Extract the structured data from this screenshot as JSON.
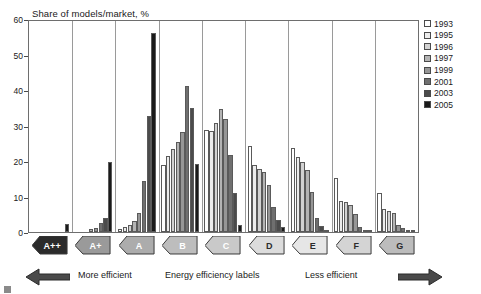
{
  "chart": {
    "title": "Share of models/market, %",
    "yaxis": {
      "label": "Share of models/market, %",
      "ticks": [
        "0",
        "10",
        "20",
        "30",
        "40",
        "50",
        "60"
      ]
    },
    "footer": {
      "more_efficient": "More efficient",
      "center": "Energy efficiency labels",
      "less_efficient": "Less efficient",
      "left_arrow_icon": "arrow-left-icon",
      "right_arrow_icon": "arrow-right-icon"
    },
    "legend": {
      "position": "right",
      "entries": [
        {
          "label": "1993",
          "color": "#ffffff"
        },
        {
          "label": "1995",
          "color": "#ececec"
        },
        {
          "label": "1996",
          "color": "#d2d2d2"
        },
        {
          "label": "1997",
          "color": "#b4b4b4"
        },
        {
          "label": "1999",
          "color": "#969696"
        },
        {
          "label": "2001",
          "color": "#6f6f6f"
        },
        {
          "label": "2003",
          "color": "#4b4b4b"
        },
        {
          "label": "2005",
          "color": "#1a1a1a"
        }
      ]
    },
    "labels": [
      {
        "text": "A++",
        "fill": "#2b2b2b",
        "textColor": "#ffffff"
      },
      {
        "text": "A+",
        "fill": "#9a9a9a",
        "textColor": "#ffffff"
      },
      {
        "text": "A",
        "fill": "#acacac",
        "textColor": "#ffffff"
      },
      {
        "text": "B",
        "fill": "#bdbdbd",
        "textColor": "#ffffff"
      },
      {
        "text": "C",
        "fill": "#c9c9c9",
        "textColor": "#ffffff"
      },
      {
        "text": "D",
        "fill": "#dcdcdc",
        "textColor": "#2b2b2b"
      },
      {
        "text": "E",
        "fill": "#e6e6e6",
        "textColor": "#2b2b2b"
      },
      {
        "text": "F",
        "fill": "#d4d4d4",
        "textColor": "#2b2b2b"
      },
      {
        "text": "G",
        "fill": "#bcbcbc",
        "textColor": "#2b2b2b"
      }
    ]
  },
  "chart_data": {
    "type": "bar",
    "title": "Share of models/market, %",
    "xlabel": "Energy efficiency labels",
    "ylabel": "Share of models/market, %",
    "ylim": [
      0,
      60
    ],
    "yticks": [
      0,
      10,
      20,
      30,
      40,
      50,
      60
    ],
    "grid": false,
    "legend_position": "right",
    "categories": [
      "A++",
      "A+",
      "A",
      "B",
      "C",
      "D",
      "E",
      "F",
      "G"
    ],
    "series": [
      {
        "name": "1993",
        "color": "#ffffff",
        "values": [
          0,
          0,
          0.8,
          19.0,
          29.0,
          24.5,
          23.8,
          15.3,
          11.0
        ]
      },
      {
        "name": "1995",
        "color": "#ececec",
        "values": [
          0,
          0,
          1.5,
          21.5,
          28.8,
          19.0,
          21.3,
          8.8,
          6.5
        ]
      },
      {
        "name": "1996",
        "color": "#d2d2d2",
        "values": [
          0,
          0,
          2.0,
          23.5,
          31.0,
          18.0,
          19.8,
          8.5,
          6.0
        ]
      },
      {
        "name": "1997",
        "color": "#b4b4b4",
        "values": [
          0,
          0.8,
          3.0,
          25.5,
          35.0,
          17.0,
          17.5,
          7.8,
          5.5
        ]
      },
      {
        "name": "1999",
        "color": "#969696",
        "values": [
          0,
          1.2,
          5.5,
          28.5,
          32.0,
          13.5,
          11.5,
          5.0,
          2.0
        ]
      },
      {
        "name": "2001",
        "color": "#6f6f6f",
        "values": [
          0,
          2.5,
          14.5,
          41.5,
          22.0,
          7.0,
          4.0,
          1.5,
          1.0
        ]
      },
      {
        "name": "2003",
        "color": "#4b4b4b",
        "values": [
          0,
          4.0,
          33.0,
          35.2,
          11.0,
          3.5,
          1.8,
          0.6,
          0.5
        ]
      },
      {
        "name": "2005",
        "color": "#1a1a1a",
        "values": [
          2.2,
          20.0,
          48.0,
          19.2,
          2.0,
          1.5,
          0.5,
          0.3,
          0.3
        ]
      }
    ],
    "peak": {
      "category": "A",
      "series": "2005",
      "value": 56.5
    }
  }
}
